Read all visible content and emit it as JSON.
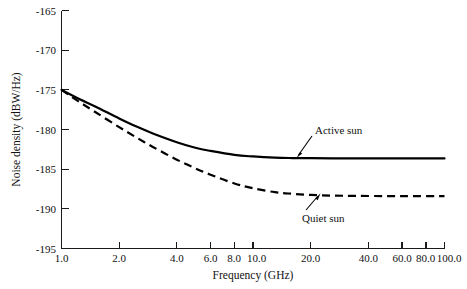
{
  "chart_data": {
    "type": "line",
    "title": "",
    "xlabel": "Frequency (GHz)",
    "ylabel": "Noise density (dBW/Hz)",
    "xscale": "log",
    "xlim": [
      1.0,
      100.0
    ],
    "ylim": [
      -195,
      -165
    ],
    "grid": false,
    "legend_position": "inline-annotations",
    "xticks": [
      1.0,
      2.0,
      4.0,
      6.0,
      8.0,
      10.0,
      20.0,
      40.0,
      60.0,
      80.0,
      100.0
    ],
    "xticklabels": [
      "1.0",
      "2.0",
      "4.0",
      "6.0",
      "8.0",
      "10.0",
      "20.0",
      "40.0",
      "60.0",
      "80.0",
      "100.0"
    ],
    "yticks": [
      -165,
      -170,
      -175,
      -180,
      -185,
      -190,
      -195
    ],
    "yticklabels": [
      "-165",
      "-170",
      "-175",
      "-180",
      "-185",
      "-190",
      "-195"
    ],
    "series": [
      {
        "name": "Active sun",
        "style": "solid",
        "color": "#000000",
        "x": [
          1.0,
          1.2,
          1.5,
          2.0,
          2.5,
          3.0,
          4.0,
          5.0,
          6.0,
          8.0,
          10.0,
          13.0,
          16.0,
          20.0,
          26.0,
          35.0,
          50.0,
          70.0,
          100.0
        ],
        "y": [
          -175.0,
          -176.0,
          -177.1,
          -178.6,
          -179.7,
          -180.5,
          -181.6,
          -182.3,
          -182.7,
          -183.2,
          -183.4,
          -183.55,
          -183.6,
          -183.62,
          -183.63,
          -183.64,
          -183.64,
          -183.64,
          -183.64
        ]
      },
      {
        "name": "Quiet sun",
        "style": "dashed",
        "color": "#000000",
        "x": [
          1.0,
          1.2,
          1.5,
          2.0,
          2.5,
          3.0,
          4.0,
          5.0,
          6.0,
          8.0,
          10.0,
          13.0,
          16.0,
          20.0,
          26.0,
          35.0,
          50.0,
          70.0,
          100.0
        ],
        "y": [
          -175.0,
          -176.3,
          -177.8,
          -179.7,
          -181.1,
          -182.2,
          -183.8,
          -184.9,
          -185.7,
          -186.8,
          -187.4,
          -187.9,
          -188.1,
          -188.25,
          -188.33,
          -188.37,
          -188.39,
          -188.4,
          -188.4
        ]
      }
    ],
    "annotations": [
      {
        "text": "Active sun",
        "points_to": "active-sun-curve"
      },
      {
        "text": "Quiet sun",
        "points_to": "quiet-sun-curve"
      }
    ]
  }
}
